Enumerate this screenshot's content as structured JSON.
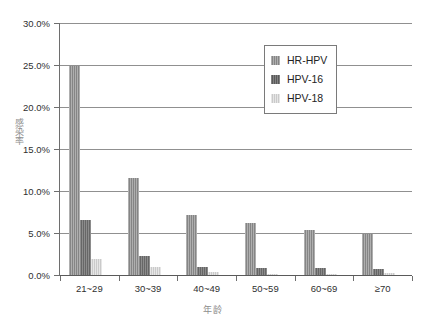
{
  "chart_data": {
    "type": "bar",
    "title": "",
    "subtitle": "",
    "xlabel": "年龄",
    "ylabel": "感染率",
    "categories": [
      "21~29",
      "30~39",
      "40~49",
      "50~59",
      "60~69",
      "≥70"
    ],
    "series": [
      {
        "name": "HR-HPV",
        "values": [
          24.9,
          11.5,
          7.2,
          6.2,
          5.4,
          4.9
        ],
        "color": "#8c8c8c"
      },
      {
        "name": "HPV-16",
        "values": [
          6.6,
          2.3,
          0.9,
          0.8,
          0.8,
          0.7
        ],
        "color": "#6b6b6b"
      },
      {
        "name": "HPV-18",
        "values": [
          1.9,
          0.9,
          0.4,
          0.15,
          0.1,
          0.2
        ],
        "color": "#d2d2d2"
      }
    ],
    "ylim": [
      0,
      30
    ],
    "ytick_values": [
      0,
      5,
      10,
      15,
      20,
      25,
      30
    ],
    "ytick_labels": [
      "0.0%",
      "5.0%",
      "10.0%",
      "15.0%",
      "20.0%",
      "25.0%",
      "30.0%"
    ],
    "grid": true,
    "grid_axis": "y",
    "legend": {
      "position": "top-right",
      "entries": [
        "HR-HPV",
        "HPV-16",
        "HPV-18"
      ]
    }
  }
}
